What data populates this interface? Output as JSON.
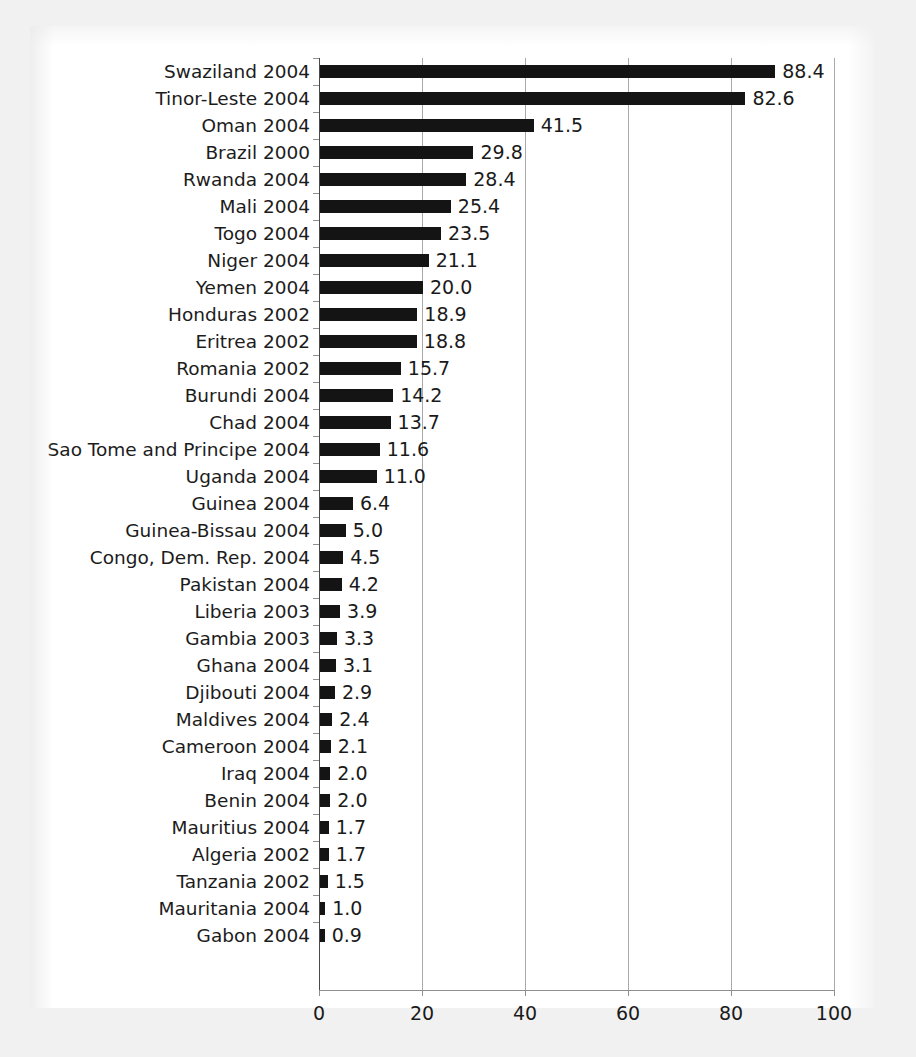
{
  "figure": {
    "background_color": "#ffffff",
    "paper_edge_color": "#f1f1f1",
    "bar_color": "#141414",
    "gridline_color": "#a9a9a9",
    "axis_color": "#8f8f8f",
    "text_color": "#1a1a1a"
  },
  "chart_data": {
    "type": "bar",
    "orientation": "horizontal",
    "title": "",
    "subtitle": "",
    "xlabel": "",
    "ylabel": "",
    "xlim": [
      0,
      100
    ],
    "xticks": [
      "0",
      "20",
      "40",
      "60",
      "80",
      "100"
    ],
    "xtick_values": [
      0,
      20,
      40,
      60,
      80,
      100
    ],
    "grid": "vertical",
    "legend": "none",
    "series_name": "",
    "value_labels_shown": true,
    "categories": [
      "Swaziland 2004",
      "Tinor-Leste 2004",
      "Oman 2004",
      "Brazil 2000",
      "Rwanda 2004",
      "Mali 2004",
      "Togo 2004",
      "Niger 2004",
      "Yemen 2004",
      "Honduras 2002",
      "Eritrea 2002",
      "Romania 2002",
      "Burundi 2004",
      "Chad 2004",
      "Sao Tome and Principe 2004",
      "Uganda 2004",
      "Guinea 2004",
      "Guinea-Bissau 2004",
      "Congo, Dem. Rep. 2004",
      "Pakistan 2004",
      "Liberia 2003",
      "Gambia 2003",
      "Ghana 2004",
      "Djibouti 2004",
      "Maldives 2004",
      "Cameroon 2004",
      "Iraq 2004",
      "Benin 2004",
      "Mauritius 2004",
      "Algeria 2002",
      "Tanzania 2002",
      "Mauritania 2004",
      "Gabon 2004"
    ],
    "values": [
      88.4,
      82.6,
      41.5,
      29.8,
      28.4,
      25.4,
      23.5,
      21.1,
      20.0,
      18.9,
      18.8,
      15.7,
      14.2,
      13.7,
      11.6,
      11.0,
      6.4,
      5.0,
      4.5,
      4.2,
      3.9,
      3.3,
      3.1,
      2.9,
      2.4,
      2.1,
      2.0,
      2.0,
      1.7,
      1.7,
      1.5,
      1.0,
      0.9
    ],
    "value_labels": [
      "88.4",
      "82.6",
      "41.5",
      "29.8",
      "28.4",
      "25.4",
      "23.5",
      "21.1",
      "20.0",
      "18.9",
      "18.8",
      "15.7",
      "14.2",
      "13.7",
      "11.6",
      "11.0",
      "6.4",
      "5.0",
      "4.5",
      "4.2",
      "3.9",
      "3.3",
      "3.1",
      "2.9",
      "2.4",
      "2.1",
      "2.0",
      "2.0",
      "1.7",
      "1.7",
      "1.5",
      "1.0",
      "0.9"
    ]
  }
}
